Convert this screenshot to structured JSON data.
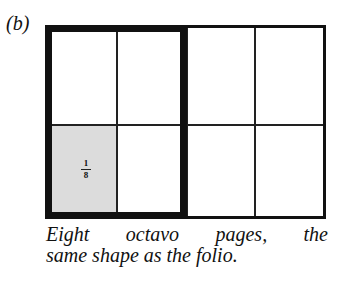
{
  "figure": {
    "label": "(b)",
    "grid": {
      "rows": 2,
      "columns": 4,
      "highlighted_cell": {
        "row": 2,
        "column": 1
      },
      "thick_outline_columns": [
        1,
        2
      ]
    },
    "cell_fraction": {
      "numerator": "1",
      "denominator": "8"
    },
    "caption_line1": [
      "Eight",
      "octavo",
      "pages,",
      "the"
    ],
    "caption_line2": "same shape as the folio."
  },
  "colors": {
    "ink": "#111111",
    "shade": "#dcdcdc",
    "background": "#ffffff"
  }
}
